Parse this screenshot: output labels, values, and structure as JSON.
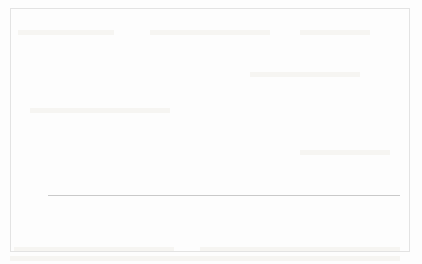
{
  "chart_data": {
    "type": "bar",
    "subtype": "stacked-bar",
    "title": "",
    "subtitle": "",
    "xlabel": "",
    "ylabel": "",
    "ylim": [
      0.0,
      8.0
    ],
    "ytick_step": 1.0,
    "ytick_labels": [
      "8.0",
      "7.0",
      "6.0",
      "5.0",
      "4.0",
      "3.0",
      "2.0",
      "1.0",
      "0.0"
    ],
    "ytick_values": [
      8.0,
      7.0,
      6.0,
      5.0,
      4.0,
      3.0,
      2.0,
      1.0,
      0.0
    ],
    "grid": true,
    "grid_orientation": "horizontal",
    "legend_position": "bottom-center",
    "categories": [
      "1974-1981",
      "1982-1989",
      "1990-1998",
      "1999-2007",
      "2008-2013"
    ],
    "series": [
      {
        "name": "GDP per capita Growth",
        "color": "#c0c0c0",
        "stack_position": "bottom",
        "values": [
          1.5,
          1.2,
          5.5,
          3.3,
          2.7
        ],
        "value_labels": [
          "1.5",
          "1.2",
          "5.5",
          "3.3",
          "2.7"
        ]
      },
      {
        "name": "GDP Growth",
        "color": "#333333",
        "stack_position": "top",
        "values": [
          1.5,
          1.7,
          1.6,
          1.0,
          1.1
        ],
        "value_labels": [
          "",
          "",
          "",
          "",
          ""
        ]
      }
    ],
    "totals": [
      3.0,
      2.9,
      7.1,
      4.3,
      3.8
    ],
    "total_labels": [
      "3.0",
      "2.9",
      "7.1",
      "4.3",
      "3.8"
    ],
    "annotations": []
  },
  "legend": {
    "items": [
      {
        "label": "GDP per capita Growth",
        "color": "#c0c0c0"
      },
      {
        "label": "GDP Growth",
        "color": "#333333"
      }
    ]
  },
  "colors": {
    "series_light": "#c0c0c0",
    "series_dark": "#333333",
    "gridline": "#d9d9d9",
    "text": "#1a1a1a",
    "frame": "#e3e3e3",
    "background": "#fdfdfd"
  }
}
